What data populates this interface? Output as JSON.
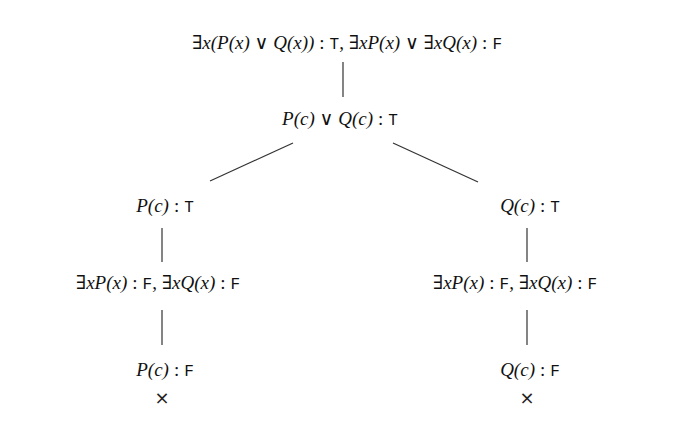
{
  "diagram": {
    "type": "semantic-tableau-tree",
    "nodes": {
      "root": {
        "formula1": "∃x(P(x) ∨ Q(x))",
        "value1": "T",
        "formula2": "∃xP(x) ∨ ∃xQ(x)",
        "value2": "F"
      },
      "disjunction": {
        "formula": "P(c) ∨ Q(c)",
        "value": "T"
      },
      "left_branch": {
        "node1": {
          "formula": "P(c)",
          "value": "T"
        },
        "node2": {
          "formula1": "∃xP(x)",
          "value1": "F",
          "formula2": "∃xQ(x)",
          "value2": "F"
        },
        "node3": {
          "formula": "P(c)",
          "value": "F"
        },
        "closed_marker": "×"
      },
      "right_branch": {
        "node1": {
          "formula": "Q(c)",
          "value": "T"
        },
        "node2": {
          "formula1": "∃xP(x)",
          "value1": "F",
          "formula2": "∃xQ(x)",
          "value2": "F"
        },
        "node3": {
          "formula": "Q(c)",
          "value": "F"
        },
        "closed_marker": "×"
      }
    },
    "separator": ":",
    "comma": ","
  }
}
